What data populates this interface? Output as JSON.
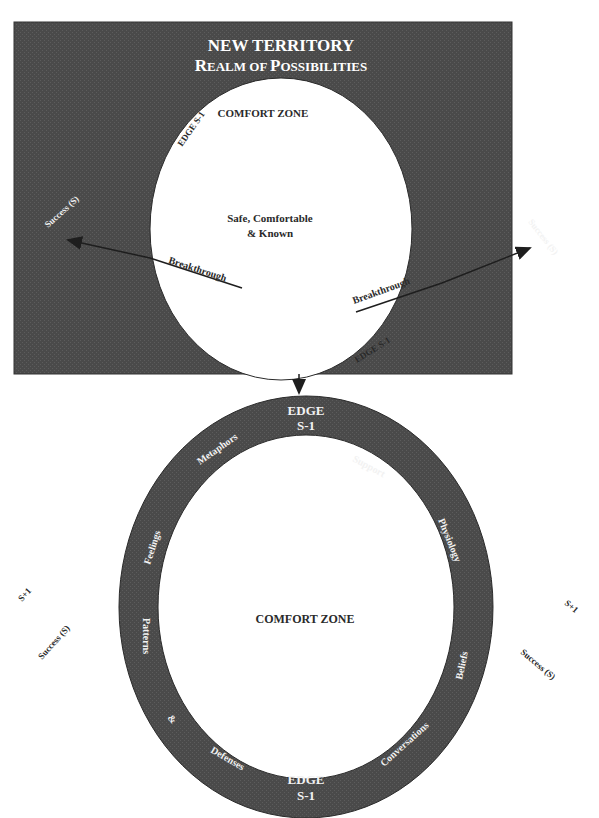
{
  "colors": {
    "territory_fill": "#4a4a4a",
    "ring_fill": "#4d4d4d",
    "circle_fill": "#ffffff",
    "dark_text": "#2a2a2a",
    "light_text": "#f2f2f2",
    "arrow": "#222222"
  },
  "top_panel": {
    "title_line1": "NEW TERRITORY",
    "title_line2_cap1": "R",
    "title_line2_rest1": "EALM OF ",
    "title_line2_cap2": "P",
    "title_line2_rest2": "OSSIBILITIES",
    "comfort_zone_label": "COMFORT ZONE",
    "center_line1": "Safe, Comfortable",
    "center_line2": "& Known",
    "edge_top_left": "EDGE   S-1",
    "edge_bottom_right": "EDGE   S-1",
    "breakthrough_left": "Breakthrough",
    "breakthrough_right": "Breakthrough",
    "success_left": "Success (S)",
    "success_right": "Success (S)"
  },
  "bottom_panel": {
    "comfort_zone_label": "COMFORT ZONE",
    "edge_top_line1": "EDGE",
    "edge_top_line2": "S-1",
    "edge_bottom_line1": "EDGE",
    "edge_bottom_line2": "S-1",
    "ring_labels": {
      "metaphors": "Metaphors",
      "support": "Support",
      "feelings": "Feelings",
      "physiology": "Physiology",
      "patterns": "Patterns",
      "beliefs": "Beliefs",
      "ampersand": "&",
      "defenses": "Defenses",
      "conversations": "Conversations"
    },
    "left_s_plus": "S+1",
    "left_success": "Success (S)",
    "right_s_plus": "S+1",
    "right_success": "Success (S)"
  }
}
